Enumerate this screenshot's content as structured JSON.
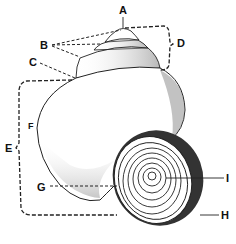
{
  "diagram": {
    "labels": [
      {
        "id": "A",
        "text": "A",
        "x": 119,
        "y": 5
      },
      {
        "id": "B",
        "text": "B",
        "x": 40,
        "y": 40
      },
      {
        "id": "C",
        "text": "C",
        "x": 29,
        "y": 57
      },
      {
        "id": "D",
        "text": "D",
        "x": 177,
        "y": 38
      },
      {
        "id": "E",
        "text": "E",
        "x": 5,
        "y": 143
      },
      {
        "id": "F",
        "text": "F",
        "x": 28,
        "y": 121
      },
      {
        "id": "G",
        "text": "G",
        "x": 37,
        "y": 182
      },
      {
        "id": "H",
        "text": "H",
        "x": 221,
        "y": 210
      },
      {
        "id": "I",
        "text": "I",
        "x": 226,
        "y": 173
      }
    ]
  }
}
